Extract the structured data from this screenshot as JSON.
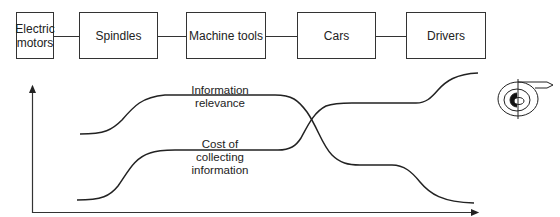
{
  "chain": {
    "boxes": [
      {
        "label": "Electric motors",
        "line1": "Electric",
        "line2": "motors"
      },
      {
        "label": "Spindles"
      },
      {
        "label": "Machine tools"
      },
      {
        "label": "Cars"
      },
      {
        "label": "Drivers"
      }
    ]
  },
  "graph": {
    "curves": [
      {
        "name": "information-relevance",
        "line1": "Information",
        "line2": "relevance"
      },
      {
        "name": "cost-of-collecting-information",
        "line1": "Cost of",
        "line2": "collecting",
        "line3": "information"
      }
    ],
    "x_axis_label": "",
    "y_axis_label": ""
  },
  "icon": {
    "name": "spiral-target-icon"
  },
  "colors": {
    "line": "#222222",
    "box_border": "#333333",
    "background": "#ffffff"
  }
}
